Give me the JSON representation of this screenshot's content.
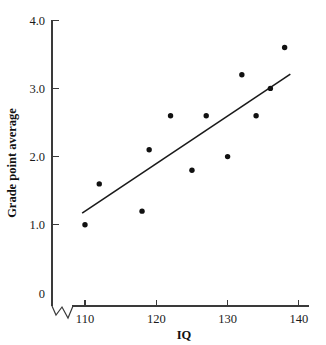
{
  "chart_data": {
    "type": "scatter",
    "title": "",
    "xlabel": "IQ",
    "ylabel": "Grade point average",
    "xlim": [
      108,
      141
    ],
    "ylim": [
      0,
      4.0
    ],
    "grid": false,
    "legend": "none",
    "x_ticks": [
      "110",
      "120",
      "130",
      "140"
    ],
    "x_tick_values": [
      110,
      120,
      130,
      140
    ],
    "y_ticks": [
      "0",
      "1.0",
      "2.0",
      "3.0",
      "4.0"
    ],
    "y_tick_values": [
      0,
      1.0,
      2.0,
      3.0,
      4.0
    ],
    "axis_break": "x-axis broken between 0 and 110",
    "x": [
      110,
      112,
      118,
      119,
      122,
      125,
      127,
      130,
      132,
      134,
      136,
      138
    ],
    "y": [
      1.0,
      1.6,
      1.2,
      2.1,
      2.6,
      1.8,
      2.6,
      2.0,
      3.2,
      2.6,
      3.0,
      3.6
    ],
    "points": [
      {
        "x": 110,
        "y": 1.0
      },
      {
        "x": 112,
        "y": 1.6
      },
      {
        "x": 118,
        "y": 1.2
      },
      {
        "x": 119,
        "y": 2.1
      },
      {
        "x": 122,
        "y": 2.6
      },
      {
        "x": 125,
        "y": 1.8
      },
      {
        "x": 127,
        "y": 2.6
      },
      {
        "x": 130,
        "y": 2.0
      },
      {
        "x": 132,
        "y": 3.2
      },
      {
        "x": 134,
        "y": 2.6
      },
      {
        "x": 136,
        "y": 3.0
      },
      {
        "x": 138,
        "y": 3.6
      }
    ],
    "trend_line": {
      "x_start": 109.6,
      "y_start": 1.17,
      "x_end": 138.8,
      "y_end": 3.21
    },
    "marker_color": "#111111",
    "line_color": "#1a1a1a",
    "axis_color": "#3a3a3a",
    "background_color": "#ffffff"
  }
}
